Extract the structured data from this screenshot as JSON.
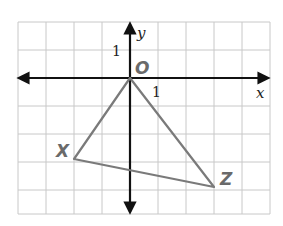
{
  "diagram": {
    "type": "coordinate-plane-triangle",
    "grid": {
      "cols": 9,
      "rows": 7,
      "x_min": -4,
      "x_max": 5,
      "y_min": -5,
      "y_max": 2
    },
    "axes": {
      "x_label": "x",
      "y_label": "y",
      "x_tick_label": "1",
      "y_tick_label": "1"
    },
    "vertices": [
      {
        "label": "O",
        "x": 0,
        "y": 0
      },
      {
        "label": "X",
        "x": -2,
        "y": -3
      },
      {
        "label": "Z",
        "x": 3,
        "y": -4
      }
    ],
    "colors": {
      "grid": "#c8c8c8",
      "axis": "#111111",
      "triangle": "#7a7a7a",
      "vertex_label": "#6a6a6a"
    }
  }
}
